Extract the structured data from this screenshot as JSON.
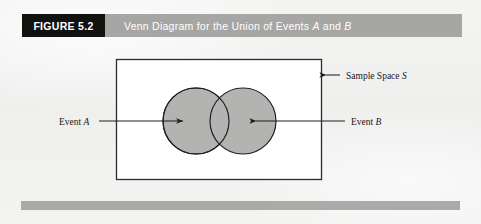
{
  "figure": {
    "tag_label": "FIGURE 5.2",
    "title_prefix": "Venn Diagram for the Union of Events ",
    "title_event_a": "A",
    "title_conjunction": " and ",
    "title_event_b": "B",
    "title_full": "Venn Diagram for the Union of Events A and B"
  },
  "diagram": {
    "type": "venn",
    "sample_space_label_prefix": "Sample Space ",
    "sample_space_label_symbol": "S",
    "event_a_label_prefix": "Event ",
    "event_a_label_symbol": "A",
    "event_b_label_prefix": "Event ",
    "event_b_label_symbol": "B"
  },
  "colors": {
    "tag_background": "#111110",
    "titlebar_background": "#a6a6a4",
    "title_text": "#ffffff",
    "page_background": "#f1f1f0",
    "rectangle_fill": "#ffffff",
    "rectangle_stroke": "#2b2b2d",
    "circle_fill": "#b3b3b1",
    "circle_stroke": "#1e1e20",
    "leader_line": "#1e1e20",
    "bottom_rule": "#aaaaa8",
    "label_text": "#18181a"
  },
  "geometry": {
    "rectangle": {
      "x": 116,
      "y": 59,
      "width": 206,
      "height": 121
    },
    "circle_a": {
      "cx": 196,
      "cy": 121,
      "r": 33
    },
    "circle_b": {
      "cx": 243,
      "cy": 121,
      "r": 33
    }
  }
}
